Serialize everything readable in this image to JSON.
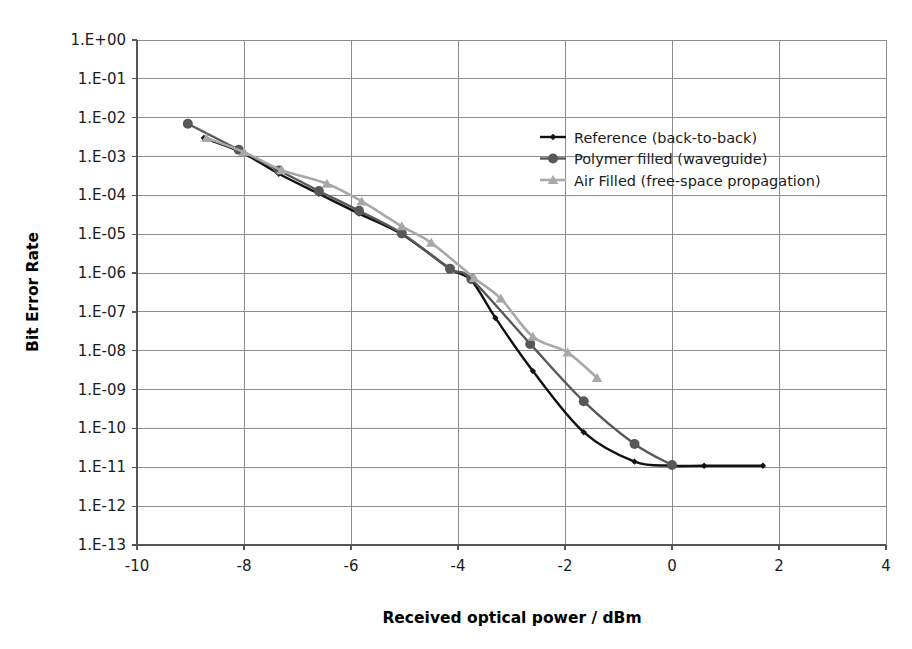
{
  "chart_data": {
    "type": "line",
    "title": "",
    "xlabel": "Received optical power / dBm",
    "ylabel": "Bit Error Rate",
    "xlim": [
      -10,
      4
    ],
    "ylim": [
      1e-13,
      1.0
    ],
    "yscale": "log",
    "grid": true,
    "legend_position": "upper-right-inside",
    "x_ticks": [
      -10,
      -8,
      -6,
      -4,
      -2,
      0,
      2,
      4
    ],
    "x_tick_labels": [
      "-10",
      "-8",
      "-6",
      "-4",
      "-2",
      "0",
      "2",
      "4"
    ],
    "y_ticks": [
      1.0,
      0.1,
      0.01,
      0.001,
      0.0001,
      1e-05,
      1e-06,
      1e-07,
      1e-08,
      1e-09,
      1e-10,
      1e-11,
      1e-12,
      1e-13
    ],
    "y_tick_labels": [
      "1.E+00",
      "1.E-01",
      "1.E-02",
      "1.E-03",
      "1.E-04",
      "1.E-05",
      "1.E-06",
      "1.E-07",
      "1.E-08",
      "1.E-09",
      "1.E-10",
      "1.E-11",
      "1.E-12",
      "1.E-13"
    ],
    "series": [
      {
        "name": "Reference (back-to-back)",
        "color": "#111111",
        "marker": "diamond",
        "marker_size": 3.2,
        "line_width": 2.4,
        "points": [
          {
            "x": -8.75,
            "y": 0.003
          },
          {
            "x": -8.05,
            "y": 0.0013
          },
          {
            "x": -7.35,
            "y": 0.00036
          },
          {
            "x": -6.6,
            "y": 0.00011
          },
          {
            "x": -5.85,
            "y": 3.4e-05
          },
          {
            "x": -5.05,
            "y": 1e-05
          },
          {
            "x": -4.15,
            "y": 1.3e-06
          },
          {
            "x": -3.75,
            "y": 6.5e-07
          },
          {
            "x": -3.3,
            "y": 7e-08
          },
          {
            "x": -2.6,
            "y": 3e-09
          },
          {
            "x": -1.65,
            "y": 8e-11
          },
          {
            "x": -0.7,
            "y": 1.4e-11
          },
          {
            "x": 0.0,
            "y": 1.1e-11
          },
          {
            "x": 0.6,
            "y": 1.1e-11
          },
          {
            "x": 1.7,
            "y": 1.1e-11
          }
        ]
      },
      {
        "name": "Polymer filled (waveguide)",
        "color": "#585858",
        "marker": "circle",
        "marker_size": 5.0,
        "line_width": 2.4,
        "points": [
          {
            "x": -9.05,
            "y": 0.007
          },
          {
            "x": -8.1,
            "y": 0.0015
          },
          {
            "x": -7.35,
            "y": 0.00044
          },
          {
            "x": -6.6,
            "y": 0.00013
          },
          {
            "x": -5.85,
            "y": 4e-05
          },
          {
            "x": -5.05,
            "y": 1.05e-05
          },
          {
            "x": -4.15,
            "y": 1.3e-06
          },
          {
            "x": -3.75,
            "y": 7e-07
          },
          {
            "x": -2.65,
            "y": 1.5e-08
          },
          {
            "x": -1.65,
            "y": 5e-10
          },
          {
            "x": -0.7,
            "y": 4e-11
          },
          {
            "x": 0.0,
            "y": 1.15e-11
          }
        ]
      },
      {
        "name": "Air Filled (free-space propagation)",
        "color": "#a8a8a8",
        "marker": "triangle",
        "marker_size": 5.0,
        "line_width": 2.6,
        "points": [
          {
            "x": -8.7,
            "y": 0.003
          },
          {
            "x": -8.0,
            "y": 0.0013
          },
          {
            "x": -7.3,
            "y": 0.00045
          },
          {
            "x": -6.45,
            "y": 0.0002
          },
          {
            "x": -5.8,
            "y": 7e-05
          },
          {
            "x": -5.05,
            "y": 1.6e-05
          },
          {
            "x": -4.5,
            "y": 6e-06
          },
          {
            "x": -3.7,
            "y": 7.5e-07
          },
          {
            "x": -3.2,
            "y": 2.2e-07
          },
          {
            "x": -2.6,
            "y": 2.3e-08
          },
          {
            "x": -1.95,
            "y": 9e-09
          },
          {
            "x": -1.4,
            "y": 2e-09
          }
        ]
      }
    ]
  },
  "legend": {
    "entries": [
      {
        "label": "Reference (back-to-back)"
      },
      {
        "label": "Polymer filled (waveguide)"
      },
      {
        "label": "Air Filled (free-space propagation)"
      }
    ]
  }
}
